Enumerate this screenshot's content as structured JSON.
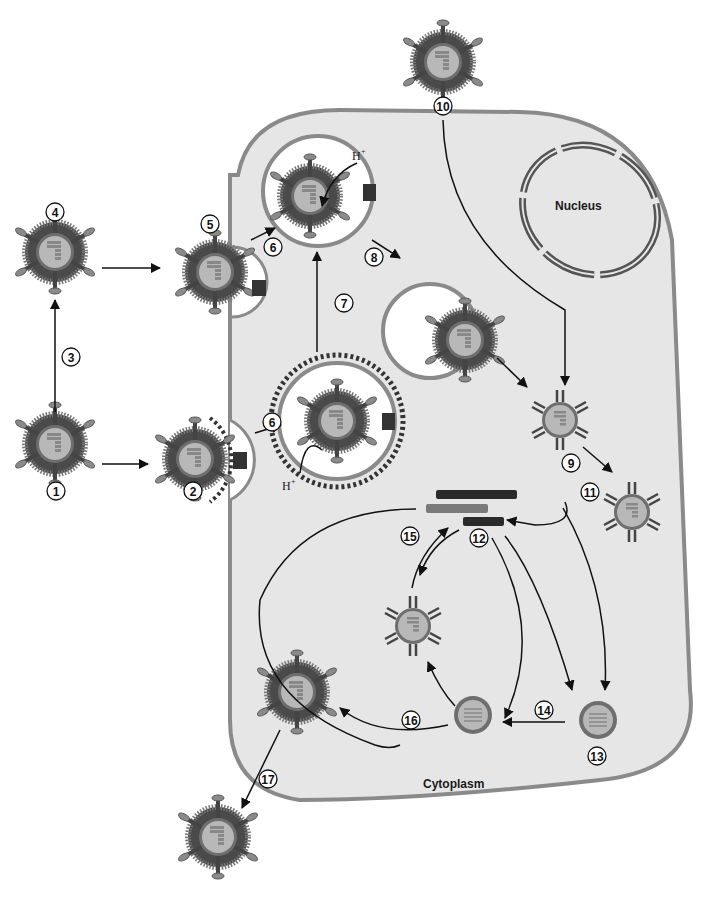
{
  "diagram": {
    "type": "virus-replication-cycle",
    "colors": {
      "cytoplasm_fill": "#e6e6e6",
      "membrane": "#8a8a8a",
      "core_fill": "#b8b8b8",
      "capsid_ring": "#6e6e6e",
      "spike": "#555555",
      "dark_bar": "#2a2a2a",
      "mid_bar": "#7a7a7a",
      "arrow": "#111111"
    },
    "labels": {
      "nucleus": "Nucleus",
      "cytoplasm": "Cytoplasm",
      "proton_top": "H",
      "proton_bottom": "H",
      "proton_sup": "+"
    },
    "steps": [
      {
        "id": "1",
        "label": "1"
      },
      {
        "id": "2",
        "label": "2"
      },
      {
        "id": "3",
        "label": "3"
      },
      {
        "id": "4",
        "label": "4"
      },
      {
        "id": "5",
        "label": "5"
      },
      {
        "id": "6a",
        "label": "6"
      },
      {
        "id": "6b",
        "label": "6"
      },
      {
        "id": "7",
        "label": "7"
      },
      {
        "id": "8",
        "label": "8"
      },
      {
        "id": "9",
        "label": "9"
      },
      {
        "id": "10",
        "label": "10"
      },
      {
        "id": "11",
        "label": "11"
      },
      {
        "id": "12",
        "label": "12"
      },
      {
        "id": "13",
        "label": "13"
      },
      {
        "id": "14",
        "label": "14"
      },
      {
        "id": "15",
        "label": "15"
      },
      {
        "id": "16",
        "label": "16"
      },
      {
        "id": "17",
        "label": "17"
      }
    ]
  }
}
